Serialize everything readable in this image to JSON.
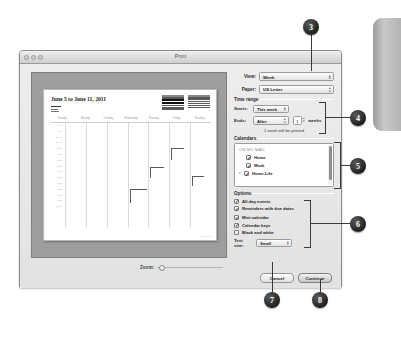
{
  "window": {
    "title": "Print",
    "traffic_lights": [
      "close",
      "minimize",
      "zoom"
    ]
  },
  "preview": {
    "page_title": "June 5 to June 11, 2011",
    "day_names": [
      "Sunday",
      "Monday",
      "Tuesday",
      "Wednesday",
      "Thursday",
      "Friday",
      "Saturday"
    ],
    "hour_labels": [
      "8 AM",
      "9 AM",
      "10 AM",
      "11 AM",
      "Noon",
      "1 PM",
      "2 PM",
      "3 PM",
      "4 PM",
      "5 PM",
      "6 PM",
      "7 PM",
      "8 PM",
      "9 PM",
      "10 PM"
    ],
    "footer": "Page 1 of 1",
    "zoom_label": "Zoom:",
    "zoom_value": "0"
  },
  "settings": {
    "view_label": "View:",
    "view_value": "Week",
    "paper_label": "Paper:",
    "paper_value": "US Letter",
    "time_range": {
      "heading": "Time range",
      "starts_label": "Starts:",
      "starts_value": "This week",
      "ends_label": "Ends:",
      "ends_value": "After",
      "count_value": "1",
      "units_label": "weeks",
      "note": "1 week will be printed"
    },
    "calendars": {
      "heading": "Calendars",
      "group_header": "ON MY MAC",
      "items": [
        {
          "label": "Home",
          "checked": true,
          "has_triangle": false
        },
        {
          "label": "Work",
          "checked": true,
          "has_triangle": false
        },
        {
          "label": "Home-Life",
          "checked": true,
          "has_triangle": true
        }
      ]
    },
    "options": {
      "heading": "Options",
      "items": [
        {
          "label": "All-day events",
          "checked": true
        },
        {
          "label": "Reminders with due dates",
          "checked": true
        },
        {
          "label": "Mini calendar",
          "checked": true
        },
        {
          "label": "Calendar keys",
          "checked": true
        },
        {
          "label": "Black and white",
          "checked": false
        }
      ],
      "text_size_label": "Text size:",
      "text_size_value": "Small"
    },
    "cancel_label": "Cancel",
    "continue_label": "Continue"
  },
  "callouts": [
    {
      "number": "3"
    },
    {
      "number": "4"
    },
    {
      "number": "5"
    },
    {
      "number": "6"
    },
    {
      "number": "7"
    },
    {
      "number": "8"
    }
  ],
  "colors": {
    "callout_fill": "#1f1f1f",
    "window_bg": "#e8e8e8",
    "preview_mat": "#9e9e9e"
  }
}
